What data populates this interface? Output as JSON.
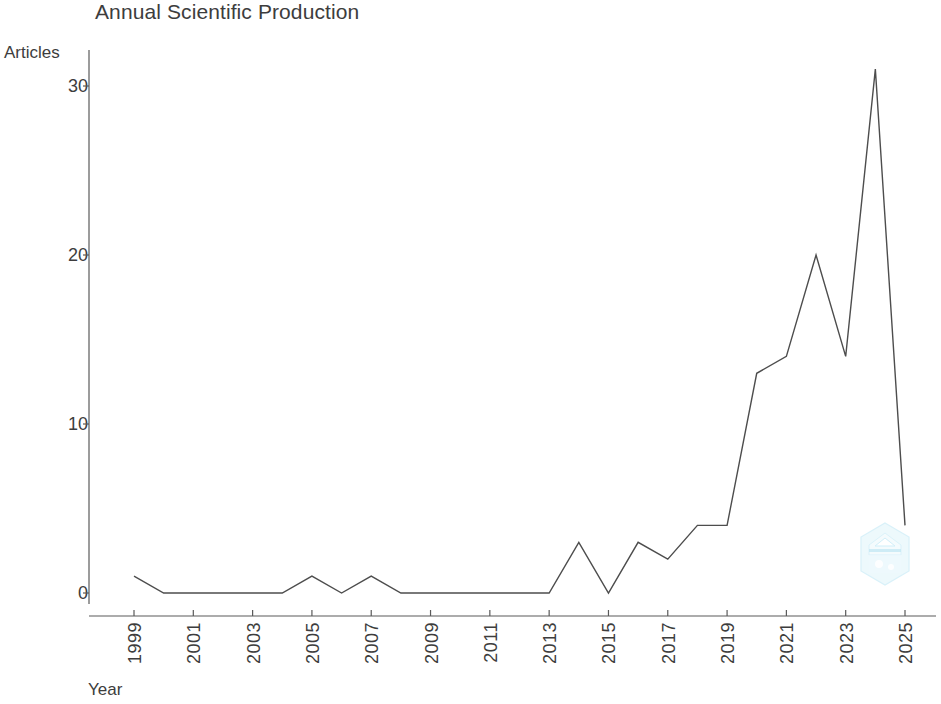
{
  "chart_data": {
    "type": "line",
    "title": "Annual Scientific Production",
    "xlabel": "Year",
    "ylabel": "Articles",
    "x": [
      1999,
      2000,
      2001,
      2002,
      2003,
      2004,
      2005,
      2006,
      2007,
      2008,
      2009,
      2010,
      2011,
      2012,
      2013,
      2014,
      2015,
      2016,
      2017,
      2018,
      2019,
      2020,
      2021,
      2022,
      2023,
      2024,
      2025
    ],
    "values": [
      1,
      0,
      0,
      0,
      0,
      0,
      1,
      0,
      1,
      0,
      0,
      0,
      0,
      0,
      0,
      3,
      0,
      3,
      2,
      4,
      4,
      13,
      14,
      20,
      14,
      31,
      4
    ],
    "series": [
      {
        "name": "Articles",
        "values": [
          1,
          0,
          0,
          0,
          0,
          0,
          1,
          0,
          1,
          0,
          0,
          0,
          0,
          0,
          0,
          3,
          0,
          3,
          2,
          4,
          4,
          13,
          14,
          20,
          14,
          31,
          4
        ]
      }
    ],
    "xlim": [
      1999,
      2025
    ],
    "ylim": [
      0,
      31
    ],
    "yticks": [
      "0",
      "10",
      "20",
      "30"
    ],
    "ytick_values": [
      0,
      10,
      20,
      30
    ],
    "xticks": [
      "1999",
      "2001",
      "2003",
      "2005",
      "2007",
      "2009",
      "2011",
      "2013",
      "2015",
      "2017",
      "2019",
      "2021",
      "2023",
      "2025"
    ],
    "xtick_values": [
      1999,
      2001,
      2003,
      2005,
      2007,
      2009,
      2011,
      2013,
      2015,
      2017,
      2019,
      2021,
      2023,
      2025
    ],
    "grid": false,
    "legend": "none",
    "line_color": "#4d4d4d"
  },
  "watermark": {
    "name": "hexagon-logo-watermark",
    "color": "#7fd6f0"
  }
}
